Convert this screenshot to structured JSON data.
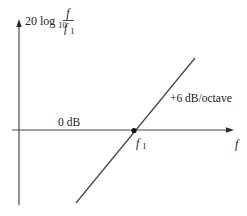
{
  "diagram": {
    "colors": {
      "background": "#ffffff",
      "axis": "#4a4a4a",
      "asymptote": "#4a4a4a",
      "text": "#222222",
      "point": "#111111"
    },
    "y_axis": {
      "label_prefix": "20 log",
      "label_subscript": "10",
      "fraction_numerator": "f",
      "fraction_denominator": "f",
      "fraction_denominator_subscript": "1"
    },
    "x_axis": {
      "label": "f"
    },
    "annotations": {
      "zero_db": "0 dB",
      "slope": "+6 dB/octave",
      "corner_label": "f",
      "corner_label_subscript": "1"
    },
    "geometry": {
      "y_axis": {
        "x": 19,
        "y_top": 20,
        "y_bottom": 205
      },
      "x_axis": {
        "y": 130,
        "x_left": 12,
        "x_right": 234
      },
      "asymptote": {
        "x1": 76,
        "y1": 203,
        "x2": 195,
        "y2": 58
      },
      "corner_point": {
        "x": 134,
        "y": 130
      }
    }
  }
}
